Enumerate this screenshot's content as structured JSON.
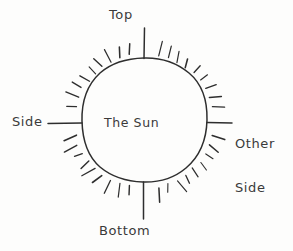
{
  "diagram": {
    "title": "The Sun",
    "type": "hand-drawn-sketch",
    "background_color": "#fdfdfc",
    "ink_color": "#2e2e2e",
    "center_label": "The Sun",
    "labels": {
      "top": "Top",
      "bottom": "Bottom",
      "side": "Side",
      "other_side_line1": "Other",
      "other_side_line2": "Side"
    },
    "callouts": [
      {
        "name": "top",
        "text": "Top",
        "direction": "up"
      },
      {
        "name": "bottom",
        "text": "Bottom",
        "direction": "down"
      },
      {
        "name": "side",
        "text": "Side",
        "direction": "left"
      },
      {
        "name": "other-side",
        "text": "Other Side",
        "direction": "right"
      }
    ],
    "geometry": {
      "circle_center_x": 144,
      "circle_center_y": 121,
      "circle_radius_x": 63,
      "circle_radius_y": 61,
      "ray_count": 44
    }
  }
}
